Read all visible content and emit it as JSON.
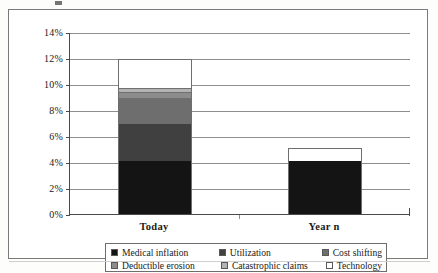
{
  "chart_data": {
    "type": "bar",
    "subtype": "stacked-column",
    "title": "",
    "xlabel": "",
    "ylabel": "",
    "categories": [
      "Today",
      "Year n"
    ],
    "ylim": [
      0,
      14
    ],
    "y_unit": "%",
    "y_ticks": [
      0,
      2,
      4,
      6,
      8,
      10,
      12,
      14
    ],
    "y_tick_labels": [
      "0%",
      "2%",
      "4%",
      "6%",
      "8%",
      "10%",
      "12%",
      "14%"
    ],
    "grid": true,
    "legend_position": "bottom",
    "series": [
      {
        "name": "Medical inflation",
        "color": "#141414",
        "values": [
          4.1,
          4.1
        ]
      },
      {
        "name": "Utilization",
        "color": "#404040",
        "values": [
          2.9,
          0
        ]
      },
      {
        "name": "Cost shifting",
        "color": "#6e6e6e",
        "values": [
          1.9,
          0
        ]
      },
      {
        "name": "Deductible erosion",
        "color": "#8c8c8c",
        "values": [
          0.5,
          0
        ]
      },
      {
        "name": "Catastrophic claims",
        "color": "#b3b3b3",
        "values": [
          0.3,
          0
        ]
      },
      {
        "name": "Technology",
        "color": "#ffffff",
        "values": [
          2.2,
          1.0
        ]
      }
    ],
    "totals": [
      11.9,
      5.1
    ]
  },
  "axis": {
    "y_tick_labels": [
      "14%",
      "12%",
      "10%",
      "8%",
      "6%",
      "4%",
      "2%",
      "0%"
    ],
    "category_labels": [
      "Today",
      "Year n"
    ]
  },
  "legend": {
    "rows": [
      [
        {
          "label": "Medical inflation",
          "color": "#141414"
        },
        {
          "label": "Utilization",
          "color": "#404040"
        },
        {
          "label": "Cost shifting",
          "color": "#6e6e6e"
        }
      ],
      [
        {
          "label": "Deductible erosion",
          "color": "#8c8c8c"
        },
        {
          "label": "Catastrophic claims",
          "color": "#b3b3b3"
        },
        {
          "label": "Technology",
          "color": "#ffffff"
        }
      ]
    ]
  }
}
